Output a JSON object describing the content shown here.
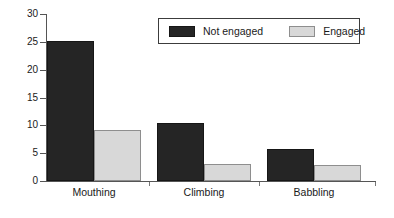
{
  "chart_data": {
    "type": "bar",
    "title": "",
    "xlabel": "",
    "ylabel": "",
    "categories": [
      "Mouthing",
      "Climbing",
      "Babbling"
    ],
    "series": [
      {
        "name": "Not engaged",
        "color": "#252525",
        "values": [
          25.1,
          10.5,
          5.8
        ]
      },
      {
        "name": "Engaged",
        "color": "#d8d8d8",
        "values": [
          9.2,
          3.0,
          2.9
        ]
      }
    ],
    "ylim": [
      0,
      30
    ],
    "yticks": [
      0,
      5,
      10,
      15,
      20,
      25,
      30
    ],
    "ytick_labels": [
      "0",
      "5",
      "10",
      "15",
      "20",
      "25",
      "30"
    ],
    "grid": false,
    "legend_position": "top-right"
  },
  "legend": {
    "entries": [
      {
        "label": "Not engaged",
        "swatch": "dark-swatch"
      },
      {
        "label": "Engaged",
        "swatch": "light-swatch"
      }
    ]
  }
}
